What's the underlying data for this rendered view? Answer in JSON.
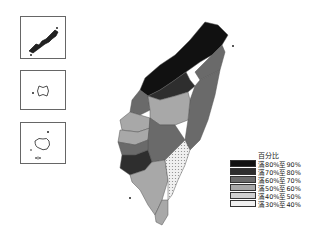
{
  "map": {
    "title": "Taiwan choropleth map by county",
    "insets": [
      {
        "name": "Kinmen / Matsu islands inset"
      },
      {
        "name": "Penghu inset"
      },
      {
        "name": "Islands inset"
      }
    ]
  },
  "legend": {
    "title": "百分比",
    "items": [
      {
        "label": "滿80%至90%",
        "color": "#111111"
      },
      {
        "label": "滿70%至80%",
        "color": "#2e2e2e"
      },
      {
        "label": "滿60%至70%",
        "color": "#6a6a6a"
      },
      {
        "label": "滿50%至60%",
        "color": "#a8a8a8"
      },
      {
        "label": "滿40%至50%",
        "color": "#cfcfcf"
      },
      {
        "label": "滿30%至40%",
        "color": "#f0f0f0"
      }
    ]
  }
}
